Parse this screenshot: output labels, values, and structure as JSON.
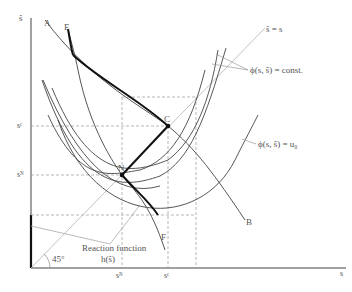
{
  "diagram": {
    "axes": {
      "x_label": "s",
      "y_label": "ŝ"
    },
    "points": [
      {
        "id": "A",
        "label": "A"
      },
      {
        "id": "E",
        "label": "E"
      },
      {
        "id": "C",
        "label": "C"
      },
      {
        "id": "N",
        "label": "N"
      },
      {
        "id": "B",
        "label": "B"
      },
      {
        "id": "F",
        "label": "F"
      }
    ],
    "ticks": {
      "y": {
        "sC": "sᶜ",
        "sN": "sᴺ"
      },
      "x": {
        "sN": "sᴺ",
        "sC": "sᶜ"
      }
    },
    "annotations": {
      "diagonal": "ŝ = s",
      "indifference": "ϕ(s, ŝ) = const.",
      "reservation": "ϕ(s, ŝ) = u₀",
      "reaction_line1": "Reaction  function",
      "reaction_line2": "h(ŝ)",
      "angle": "45°"
    }
  }
}
